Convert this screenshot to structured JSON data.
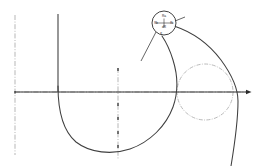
{
  "figure": {
    "background_color": "#ffffff",
    "width": 255,
    "height": 166,
    "line_color": "#3a3a3a",
    "axis_color": "#2b2b2b",
    "centerline_color": "#8c8c8c",
    "callout_color": "#1a1a1a"
  },
  "axes": {
    "horizontal": {
      "name": "horizontal-axis",
      "x_start": 15,
      "x_end": 248,
      "y": 92,
      "has_arrowhead": true,
      "arrow_end": "right"
    },
    "vertical_solid": {
      "name": "vertical-line",
      "x": 58,
      "y_start": 14,
      "y_end": 92
    }
  },
  "centerlines": [
    {
      "name": "left-centerline",
      "orientation": "vertical",
      "x": 15,
      "y_start": 15,
      "y_end": 155,
      "style": "dash-dot"
    },
    {
      "name": "center-centerline",
      "orientation": "vertical",
      "x": 118,
      "y_start": 68,
      "y_end": 160,
      "style": "dash-dot"
    },
    {
      "name": "axis-centerline",
      "orientation": "horizontal",
      "x_start": 15,
      "x_end": 248,
      "y": 92,
      "style": "dash-dot"
    }
  ],
  "base_circle": {
    "name": "base-circle",
    "center_x": 205,
    "center_y": 92,
    "radius": 28,
    "style": "dash-dot"
  },
  "curves": {
    "inner_spiral": {
      "name": "inner-spiral-curve",
      "description": "large U-shaped spiral from vertical line down around to upper right",
      "path": "M 58 14 L 58 86 C 58 118 72 140 95 149 C 112 155 134 152 150 140 C 166 128 175 110 177 92 C 179 74 174 56 166 42"
    },
    "outer_spiral": {
      "name": "outer-spiral-curve",
      "description": "outer arc sweeping from callout down through axis to lower right",
      "path": "M 176 20 C 196 26 214 40 226 58 C 236 73 241 86 240 100 C 239 118 235 138 231 160"
    },
    "leader_line": {
      "name": "callout-leader-line",
      "description": "leader from detail circle down-left to spiral surface",
      "path": "M 157 33 L 141 62"
    },
    "leader_stub": {
      "name": "callout-leader-stub",
      "description": "short leader from detail circle to upper right",
      "path": "M 175 22 L 184 18"
    }
  },
  "detail_callout": {
    "name": "detail-callout",
    "center_x": 164,
    "center_y": 23,
    "radius": 12,
    "labels": [
      {
        "text": "Ra",
        "x": 164,
        "y": 17
      },
      {
        "text": "Rb",
        "x": 156,
        "y": 23
      },
      {
        "text": "Rc",
        "x": 172,
        "y": 23
      },
      {
        "text": "dR",
        "x": 164,
        "y": 27
      },
      {
        "text": "e",
        "x": 161,
        "y": 34
      }
    ],
    "internal_marks": [
      {
        "name": "callout-dim-line",
        "x1": 155,
        "y1": 23,
        "x2": 174,
        "y2": 23
      },
      {
        "name": "callout-dim-line-2",
        "x1": 164,
        "y1": 18,
        "x2": 164,
        "y2": 28
      }
    ]
  },
  "tick_marks": [
    {
      "name": "centerline-tick",
      "x": 118,
      "y": 104
    },
    {
      "name": "centerline-tick",
      "x": 118,
      "y": 118
    },
    {
      "name": "centerline-tick",
      "x": 118,
      "y": 132
    },
    {
      "name": "centerline-tick",
      "x": 118,
      "y": 146
    },
    {
      "name": "axis-tick",
      "x": 176,
      "y": 92
    },
    {
      "name": "axis-tick",
      "x": 205,
      "y": 92
    },
    {
      "name": "axis-tick",
      "x": 233,
      "y": 92
    }
  ]
}
